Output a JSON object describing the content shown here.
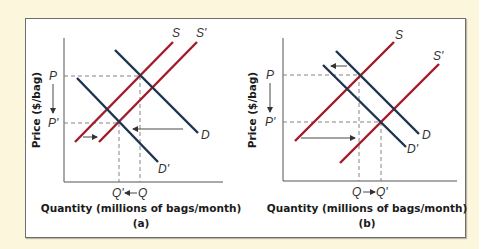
{
  "colors": {
    "background": "#fbf6dc",
    "supply_line": "#a31b2a",
    "demand_line": "#1d3350",
    "axis": "#555555",
    "guide": "#777777"
  },
  "panels": [
    {
      "id": "a",
      "tag": "(a)",
      "x_axis_title": "Quantity (millions of bags/month)",
      "y_axis_title": "Price ($/bag)",
      "curves": {
        "S": "S",
        "S_prime": "S'",
        "D": "D",
        "D_prime": "D'"
      },
      "price_labels": {
        "P": "P",
        "P_prime": "P'"
      },
      "quantity_labels": {
        "left": "Q'",
        "right": "Q",
        "arrow": "←"
      },
      "description": "Supply shifts right (S→S'), demand shifts left (D→D'); price falls P→P', quantity falls Q→Q'"
    },
    {
      "id": "b",
      "tag": "(b)",
      "x_axis_title": "Quantity (millions of bags/month)",
      "y_axis_title": "Price ($/bag)",
      "curves": {
        "S": "S",
        "S_prime": "S'",
        "D": "D",
        "D_prime": "D'"
      },
      "price_labels": {
        "P": "P",
        "P_prime": "P'"
      },
      "quantity_labels": {
        "left": "Q",
        "right": "Q'",
        "arrow": "→"
      },
      "description": "Supply shifts right strongly (S→S'), demand shifts left slightly (D→D'); price falls P→P', quantity rises Q→Q'"
    }
  ]
}
